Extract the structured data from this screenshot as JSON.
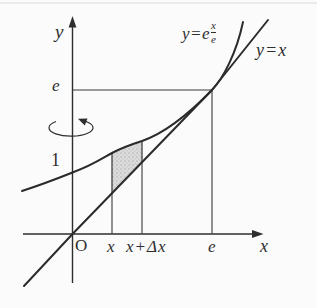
{
  "figure": {
    "labels": {
      "y_axis": "y",
      "x_axis": "x",
      "origin": "O",
      "y_tick_e": "e",
      "y_tick_1": "1",
      "x_tick_x": "x",
      "x_tick_x_dx": "x+Δx",
      "x_tick_e": "e",
      "curve_eq_prefix": "y=e",
      "curve_eq_exp_num": "x",
      "curve_eq_exp_den": "e",
      "line_eq": "y=x"
    },
    "icons": {
      "rotation_arrow": "rotate-about-y-axis-icon"
    },
    "colors": {
      "ink": "#2e2e2e",
      "shade_fill": "#d9d9d9",
      "background": "#fbfbfb"
    }
  }
}
